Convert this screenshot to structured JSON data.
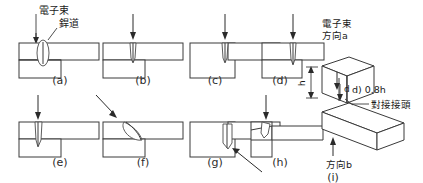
{
  "figure": {
    "title_labels": {
      "electron_beam": "電子束",
      "weld_bead": "銲道",
      "beam_direction_a": "電子束\n方向a",
      "beam_direction_a_line1": "電子束",
      "beam_direction_a_line2": "方向a",
      "direction_b": "方向b",
      "note_d": "d) 0.8h",
      "note_joint": "對接接頭",
      "dim_h": "h",
      "dim_d": "d"
    },
    "subfigures": [
      {
        "id": "a",
        "caption": "(a)",
        "joint": "T-joint, beam from top, oval bead",
        "arrow": "down"
      },
      {
        "id": "b",
        "caption": "(b)",
        "joint": "T-joint, beam from top, narrow bead",
        "arrow": "down"
      },
      {
        "id": "c",
        "caption": "(c)",
        "joint": "T-joint, beam offset right",
        "arrow": "down"
      },
      {
        "id": "d",
        "caption": "(d)",
        "joint": "T-joint, beam at corner",
        "arrow": "down"
      },
      {
        "id": "e",
        "caption": "(e)",
        "joint": "T-joint, deep penetration bead",
        "arrow": "down"
      },
      {
        "id": "f",
        "caption": "(f)",
        "joint": "T-joint, inclined beam, curved bead",
        "arrow": "diagonal-down-right"
      },
      {
        "id": "g",
        "caption": "(g)",
        "joint": "T-joint, bead indicated by pointer",
        "arrow": "diagonal-up-left"
      },
      {
        "id": "h",
        "caption": "(h)",
        "joint": "Lap joint, beam from top",
        "arrow": "down"
      },
      {
        "id": "i",
        "caption": "(i)",
        "joint": "Isometric butt joint with h and d dimensions",
        "arrow": "up"
      }
    ],
    "colors": {
      "stroke": "#3a3a3a",
      "background": "#ffffff",
      "text": "#1a1a1a",
      "arrow": "#2a2a2a"
    }
  }
}
